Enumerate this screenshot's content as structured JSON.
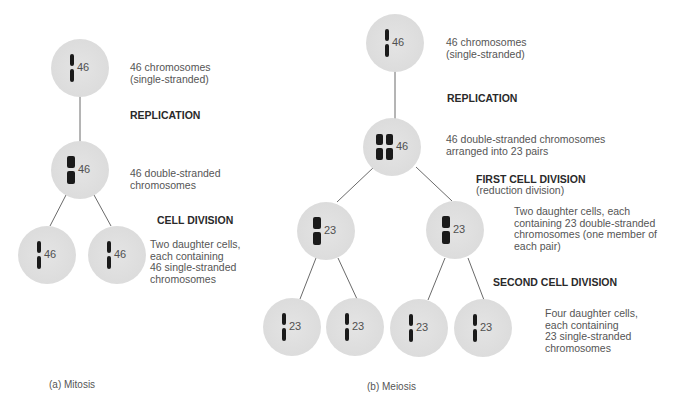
{
  "mitosis": {
    "caption": "(a)  Mitosis",
    "cells": [
      {
        "count": "46",
        "type": "single"
      },
      {
        "count": "46",
        "type": "double"
      },
      {
        "count": "46",
        "type": "single"
      },
      {
        "count": "46",
        "type": "single"
      }
    ],
    "labels": {
      "start_line1": "46 chromosomes",
      "start_line2": "(single-stranded)",
      "replication": "REPLICATION",
      "after_rep_line1": "46 double-stranded",
      "after_rep_line2": "chromosomes",
      "division": "CELL DIVISION",
      "daughters_line1": "Two daughter cells,",
      "daughters_line2": "each containing",
      "daughters_line3": "46 single-stranded",
      "daughters_line4": "chromosomes"
    }
  },
  "meiosis": {
    "caption": "(b)  Meiosis",
    "cells": [
      {
        "count": "46",
        "type": "single"
      },
      {
        "count": "46",
        "type": "pairs"
      },
      {
        "count": "23",
        "type": "double"
      },
      {
        "count": "23",
        "type": "double"
      },
      {
        "count": "23",
        "type": "single"
      },
      {
        "count": "23",
        "type": "single"
      },
      {
        "count": "23",
        "type": "single"
      },
      {
        "count": "23",
        "type": "single"
      }
    ],
    "labels": {
      "start_line1": "46 chromosomes",
      "start_line2": "(single-stranded)",
      "replication": "REPLICATION",
      "after_rep_line1": "46 double-stranded chromosomes",
      "after_rep_line2": "arranged into 23 pairs",
      "first_division": "FIRST CELL DIVISION",
      "first_division_sub": "(reduction division)",
      "first_daughters_line1": "Two daughter cells, each",
      "first_daughters_line2": "containing 23 double-stranded",
      "first_daughters_line3": "chromosomes (one member of",
      "first_daughters_line4": "each pair)",
      "second_division": "SECOND CELL DIVISION",
      "final_line1": "Four daughter cells,",
      "final_line2": "each containing",
      "final_line3": "23 single-stranded",
      "final_line4": "chromosomes"
    }
  },
  "colors": {
    "cell_fill": "#dcdcdc",
    "chromosome": "#1a1a1a",
    "line": "#6a6a6a"
  }
}
